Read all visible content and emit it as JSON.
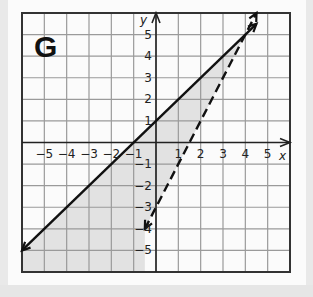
{
  "figure": {
    "label": "G",
    "x_axis_label": "x",
    "y_axis_label": "y"
  },
  "chart_data": {
    "type": "line",
    "title": "G",
    "xlabel": "x",
    "ylabel": "y",
    "xlim": [
      -6,
      6
    ],
    "ylim": [
      -6,
      6
    ],
    "grid": true,
    "x_tick_labels": [
      "-5",
      "-4",
      "-3",
      "-2",
      "-1",
      "1",
      "2",
      "3",
      "4",
      "5"
    ],
    "y_tick_labels": [
      "5",
      "4",
      "3",
      "2",
      "1",
      "-1",
      "-2",
      "-3",
      "-4",
      "-5"
    ],
    "series": [
      {
        "name": "boundary line 1",
        "style": "solid",
        "equation": "y = x + 1",
        "x": [
          -6,
          4.5
        ],
        "y": [
          -5,
          5.5
        ],
        "arrows": "both"
      },
      {
        "name": "boundary line 2",
        "style": "dashed",
        "equation": "y = 2x - 3",
        "x": [
          -0.5,
          4.5
        ],
        "y": [
          -4,
          6
        ],
        "arrows": "both"
      }
    ],
    "shaded_region": "below solid line y = x + 1 and above/left of dashed line y = 2x - 3 (y <= x + 1 and y > 2x - 3)",
    "intersection": [
      4,
      5
    ]
  },
  "colors": {
    "grid": "#9a9a9a",
    "frame": "#333333",
    "line": "#111111",
    "shade": "#e2e2e2",
    "panel": "#fbfbfb"
  }
}
